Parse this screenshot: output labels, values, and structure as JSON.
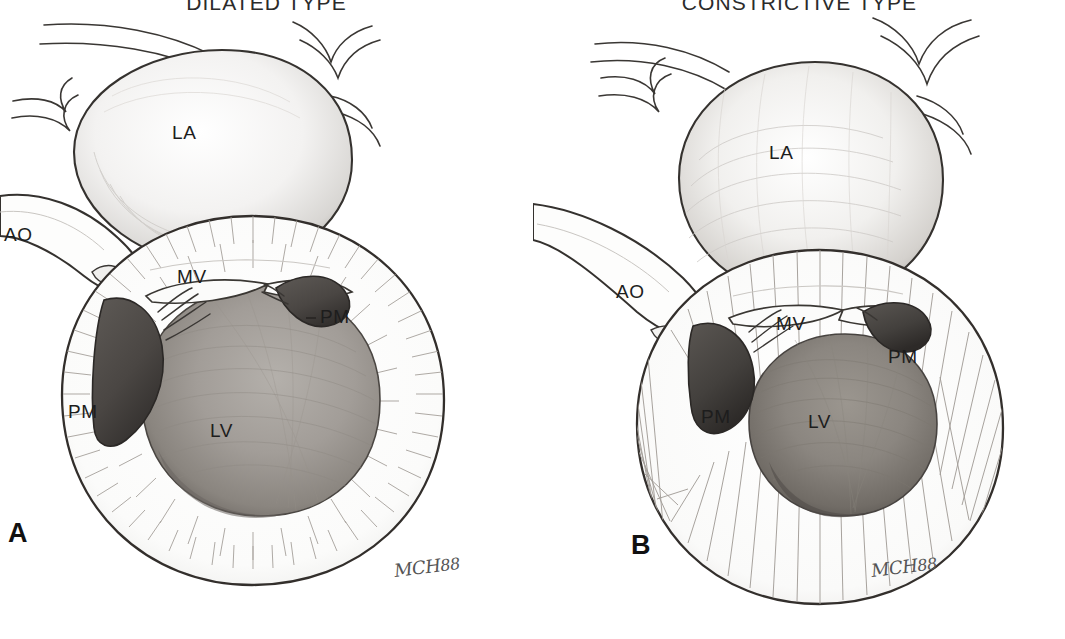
{
  "figure": {
    "caption_letters": {
      "panel_a": "A",
      "panel_b": "B"
    },
    "background_color": "#ffffff",
    "ink_color": "#1d1d1d"
  },
  "panels": [
    {
      "id": "a",
      "letter": "A",
      "title": "DILATED TYPE",
      "signature": "MCH",
      "signature_year": "88",
      "annotations": [
        {
          "name": "label-la",
          "text": "LA",
          "x": 172,
          "y": 122
        },
        {
          "name": "label-ao",
          "text": "AO",
          "x": 4,
          "y": 224
        },
        {
          "name": "label-mv",
          "text": "MV",
          "x": 177,
          "y": 266
        },
        {
          "name": "label-pm-right",
          "text": "PM",
          "x": 320,
          "y": 306
        },
        {
          "name": "label-pm-left",
          "text": "PM",
          "x": 68,
          "y": 401
        },
        {
          "name": "label-lv",
          "text": "LV",
          "x": 210,
          "y": 420
        }
      ]
    },
    {
      "id": "b",
      "letter": "B",
      "title": "CONSTRICTIVE TYPE",
      "signature": "MCH",
      "signature_year": "88",
      "annotations": [
        {
          "name": "label-la",
          "text": "LA",
          "x": 236,
          "y": 142
        },
        {
          "name": "label-ao",
          "text": "AO",
          "x": 83,
          "y": 281
        },
        {
          "name": "label-mv",
          "text": "MV",
          "x": 243,
          "y": 313
        },
        {
          "name": "label-pm-right",
          "text": "PM",
          "x": 355,
          "y": 346
        },
        {
          "name": "label-pm-left",
          "text": "PM",
          "x": 168,
          "y": 406
        },
        {
          "name": "label-lv",
          "text": "LV",
          "x": 275,
          "y": 411
        }
      ]
    }
  ],
  "legend_terms": {
    "LA": "left atrium",
    "LV": "left ventricle",
    "AO": "aorta",
    "MV": "mitral valve",
    "PM": "papillary muscle"
  }
}
